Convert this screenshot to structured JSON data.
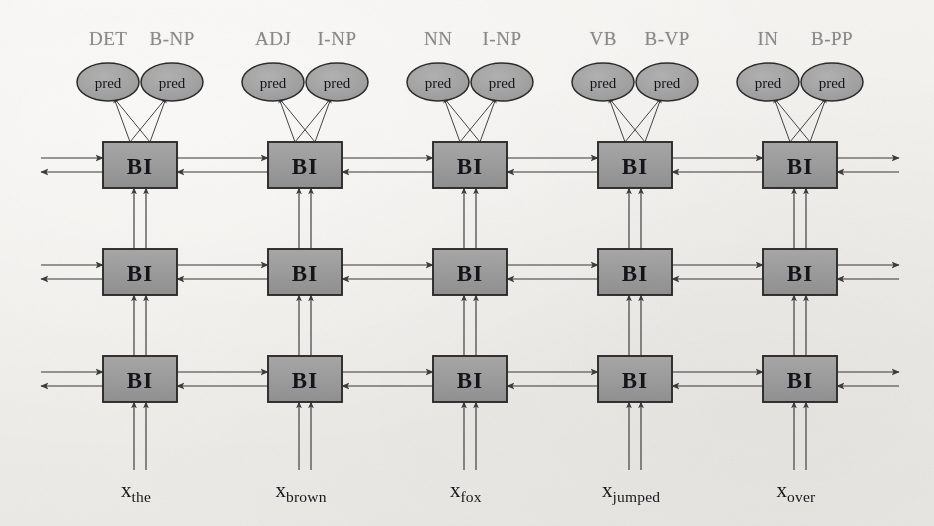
{
  "figure": {
    "type": "stacked-bidirectional-rnn-tagger",
    "layer_count": 3,
    "column_count": 5,
    "block_label": "BI",
    "pred_label": "pred",
    "colors": {
      "block_fill": "#9b9b9b",
      "block_stroke": "#2b2b2b",
      "ellipse_fill": "#a3a3a3",
      "ellipse_stroke": "#2b2b2b",
      "arrow": "#3a3a3a",
      "tag_text": "#8a8a8a",
      "token_text": "#17161a",
      "background": "#f1efeb"
    }
  },
  "columns": [
    {
      "index": 0,
      "token_base": "x",
      "token_sub": "the",
      "pos_tag": "DET",
      "chunk_tag": "B-NP",
      "preds": [
        "pred",
        "pred"
      ]
    },
    {
      "index": 1,
      "token_base": "x",
      "token_sub": "brown",
      "pos_tag": "ADJ",
      "chunk_tag": "I-NP",
      "preds": [
        "pred",
        "pred"
      ]
    },
    {
      "index": 2,
      "token_base": "x",
      "token_sub": "fox",
      "pos_tag": "NN",
      "chunk_tag": "I-NP",
      "preds": [
        "pred",
        "pred"
      ]
    },
    {
      "index": 3,
      "token_base": "x",
      "token_sub": "jumped",
      "pos_tag": "VB",
      "chunk_tag": "B-VP",
      "preds": [
        "pred",
        "pred"
      ]
    },
    {
      "index": 4,
      "token_base": "x",
      "token_sub": "over",
      "pos_tag": "IN",
      "chunk_tag": "B-PP",
      "preds": [
        "pred",
        "pred"
      ]
    }
  ],
  "layers": [
    {
      "index": 0,
      "name": "bottom-layer",
      "blocks": [
        "BI",
        "BI",
        "BI",
        "BI",
        "BI"
      ]
    },
    {
      "index": 1,
      "name": "middle-layer",
      "blocks": [
        "BI",
        "BI",
        "BI",
        "BI",
        "BI"
      ]
    },
    {
      "index": 2,
      "name": "top-layer",
      "blocks": [
        "BI",
        "BI",
        "BI",
        "BI",
        "BI"
      ]
    }
  ]
}
